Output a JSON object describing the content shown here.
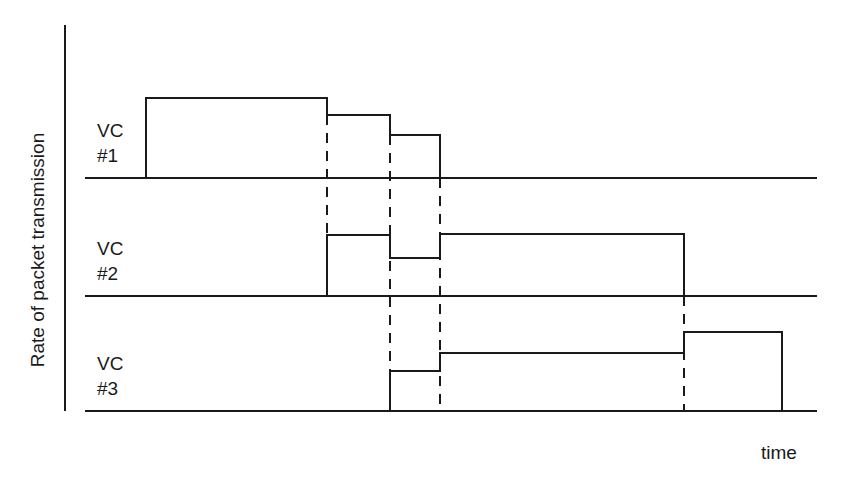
{
  "diagram": {
    "y_axis_label": "Rate of packet transmission",
    "x_axis_label": "time",
    "channels": [
      {
        "label_line1": "VC",
        "label_line2": "#1"
      },
      {
        "label_line1": "VC",
        "label_line2": "#2"
      },
      {
        "label_line1": "VC",
        "label_line2": "#3"
      }
    ],
    "line_color": "#1a1a1a"
  }
}
